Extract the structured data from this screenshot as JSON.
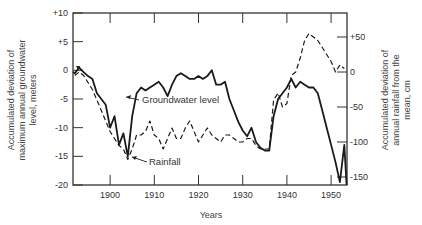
{
  "chart_data": {
    "type": "line",
    "title": "",
    "xlabel": "Years",
    "ylabel": "Accumulated deviation of maximum annual groundwater level, meters",
    "ylabel_right": "Accumulated deviation of annual rainfall from the mean, cm",
    "xlim": [
      1891.6,
      1953.6
    ],
    "ylim": [
      -20,
      10
    ],
    "ylim_right": [
      -157,
      87
    ],
    "x_ticks": [
      1900,
      1910,
      1920,
      1930,
      1940,
      1950
    ],
    "x_tick_labels": [
      "1900",
      "1910",
      "1920",
      "1930",
      "1940",
      "1950"
    ],
    "y_ticks": [
      10,
      5,
      0,
      -5,
      -10,
      -15,
      -20
    ],
    "y_tick_labels": [
      "+10",
      "+5",
      "0",
      "-5",
      "-10",
      "-15",
      "-20"
    ],
    "y_right_ticks": [
      50,
      0,
      -50,
      -100,
      -150
    ],
    "y_right_tick_labels": [
      "+50",
      "0",
      "-50",
      "-100",
      "-150"
    ],
    "grid": false,
    "legend": "none (inline annotations)",
    "annotations": [
      {
        "text": "Groundwater level",
        "arrow_to": [
          1905.5,
          -5
        ]
      },
      {
        "text": "Rainfall",
        "arrow_to": [
          1904,
          -125
        ]
      }
    ],
    "series": [
      {
        "name": "Groundwater level",
        "axis": "left",
        "style": "solid",
        "x": [
          1891.6,
          1892,
          1893,
          1894,
          1895,
          1896,
          1897,
          1898,
          1899,
          1900,
          1901,
          1902,
          1903,
          1904,
          1905,
          1906,
          1907,
          1908,
          1909,
          1910,
          1911,
          1912,
          1913,
          1914,
          1915,
          1916,
          1917,
          1918,
          1919,
          1920,
          1921,
          1922,
          1923,
          1924,
          1925,
          1926,
          1927,
          1928,
          1929,
          1930,
          1931,
          1932,
          1933,
          1934,
          1935,
          1936,
          1937,
          1938,
          1939,
          1940,
          1941,
          1942,
          1943,
          1944,
          1945,
          1946,
          1947,
          1948,
          1949,
          1950,
          1951,
          1952,
          1953,
          1953.5
        ],
        "values": [
          -0.3,
          -0.5,
          0.5,
          -0.3,
          -1,
          -1.5,
          -4,
          -5,
          -6,
          -10,
          -8,
          -13,
          -11,
          -15,
          -8,
          -4,
          -3,
          -3.5,
          -3,
          -2.5,
          -2,
          -3,
          -4.5,
          -2.5,
          -1,
          -0.5,
          -1,
          -1.5,
          -1.5,
          -1,
          -1.5,
          -1,
          0,
          -2.5,
          -2.5,
          -2,
          -5,
          -7,
          -9,
          -10.5,
          -11.5,
          -10,
          -12.5,
          -13.5,
          -14,
          -14,
          -8,
          -5,
          -4,
          -3,
          -1.5,
          -3,
          -2,
          -2.5,
          -3,
          -3,
          -4,
          -7,
          -10,
          -13,
          -16,
          -19.5,
          -13,
          -20
        ]
      },
      {
        "name": "Rainfall",
        "axis": "right",
        "style": "dashed",
        "x": [
          1892,
          1893,
          1894,
          1895,
          1896,
          1897,
          1898,
          1899,
          1900,
          1901,
          1902,
          1903,
          1904,
          1905,
          1906,
          1907,
          1908,
          1909,
          1910,
          1911,
          1912,
          1913,
          1914,
          1915,
          1916,
          1917,
          1918,
          1919,
          1920,
          1921,
          1922,
          1923,
          1924,
          1925,
          1926,
          1927,
          1928,
          1929,
          1930,
          1931,
          1932,
          1933,
          1934,
          1935,
          1936,
          1937,
          1938,
          1939,
          1940,
          1941,
          1942,
          1943,
          1944,
          1945,
          1946,
          1947,
          1948,
          1949,
          1950,
          1951,
          1952,
          1953
        ],
        "values": [
          -5,
          0,
          -5,
          -15,
          -25,
          -40,
          -55,
          -70,
          -85,
          -95,
          -105,
          -110,
          -125,
          -110,
          -90,
          -90,
          -85,
          -70,
          -90,
          -95,
          -110,
          -95,
          -80,
          -95,
          -95,
          -80,
          -70,
          -85,
          -100,
          -90,
          -80,
          -90,
          -95,
          -100,
          -90,
          -90,
          -95,
          -100,
          -100,
          -95,
          -95,
          -105,
          -110,
          -110,
          -110,
          -40,
          -30,
          -50,
          -45,
          -5,
          0,
          20,
          45,
          55,
          50,
          45,
          35,
          25,
          15,
          0,
          10,
          5
        ]
      }
    ]
  },
  "labels": {
    "xlabel": "Years",
    "ylabel_left_lines": [
      "Accumulated deviation of",
      "maximum annual groundwater",
      "level, meters"
    ],
    "ylabel_right_lines": [
      "Accumulated deviation of",
      "annual rainfall from the",
      "mean, cm"
    ],
    "groundwater_annotation": "Groundwater level",
    "rainfall_annotation": "Rainfall"
  }
}
